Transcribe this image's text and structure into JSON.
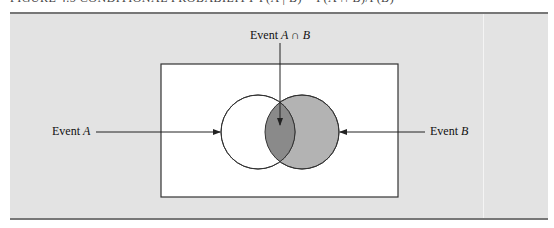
{
  "figure": {
    "caption_partial": "FIGURE 4.5 CONDITIONAL PROBABILITY P(A | B) = P(A ∩ B)/P(B)"
  },
  "diagram": {
    "labels": {
      "intersection": {
        "prefix": "Event ",
        "expr": "A ∩ B"
      },
      "event_a": {
        "prefix": "Event ",
        "var": "A"
      },
      "event_b": {
        "prefix": "Event ",
        "var": "B"
      }
    },
    "colors": {
      "panel_bg": "#e3e3e3",
      "sample_space_bg": "#ffffff",
      "event_b_fill": "#b3b3b3",
      "intersection_fill": "#8a8a8a",
      "stroke": "#333333"
    }
  }
}
